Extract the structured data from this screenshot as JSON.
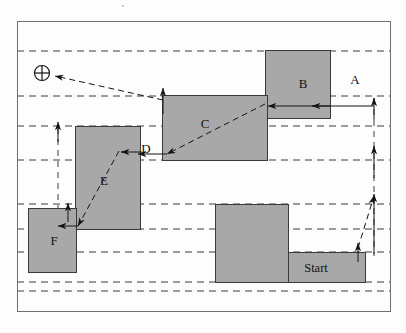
{
  "figure": {
    "width": 406,
    "height": 333,
    "background_color": "#fdfdfd",
    "frame": {
      "name": "outer-frame",
      "x": 17,
      "y": 21,
      "width": 373,
      "height": 290,
      "stroke_color": "#6f6f6f",
      "stroke_width": 1
    },
    "colors": {
      "block_fill": "#a8a8a8",
      "block_stroke": "#3a3a3a",
      "dashed_line": "#3c3c3c",
      "arrow": "#141414",
      "text": "#101010"
    }
  },
  "blocks": [
    {
      "id": "B",
      "label": "B",
      "x": 265,
      "y": 50,
      "width": 65,
      "height": 68,
      "label_x": 303,
      "label_y": 83
    },
    {
      "id": "C",
      "label": "C",
      "x": 162,
      "y": 95,
      "width": 105,
      "height": 65,
      "label_x": 205,
      "label_y": 123
    },
    {
      "id": "E",
      "label": "E",
      "x": 75,
      "y": 126,
      "width": 65,
      "height": 103,
      "label_x": 104,
      "label_y": 180
    },
    {
      "id": "F",
      "label": "F",
      "x": 28,
      "y": 208,
      "width": 48,
      "height": 64,
      "label_x": 54,
      "label_y": 240
    },
    {
      "id": "G",
      "label": "",
      "x": 215,
      "y": 204,
      "width": 73,
      "height": 78,
      "label_x": 0,
      "label_y": 0
    },
    {
      "id": "Start",
      "label": "Start",
      "x": 288,
      "y": 252,
      "width": 77,
      "height": 30,
      "label_x": 316,
      "label_y": 268
    }
  ],
  "free_labels": [
    {
      "id": "A",
      "label": "A",
      "x": 355,
      "y": 79
    },
    {
      "id": "D",
      "label": "D",
      "x": 146,
      "y": 148
    }
  ],
  "target_marker": {
    "name": "circle-plus-target-marker",
    "label": "⊕",
    "cx": 42,
    "cy": 73,
    "r": 7.5
  },
  "dashed_gridlines": [
    {
      "id": "g1",
      "y": 51,
      "x1": 17,
      "x2": 390
    },
    {
      "id": "g2",
      "y": 96,
      "x1": 17,
      "x2": 390
    },
    {
      "id": "g3",
      "y": 126,
      "x1": 17,
      "x2": 390
    },
    {
      "id": "g4",
      "y": 160,
      "x1": 17,
      "x2": 390
    },
    {
      "id": "g5",
      "y": 204,
      "x1": 17,
      "x2": 390
    },
    {
      "id": "g6",
      "y": 229,
      "x1": 17,
      "x2": 390
    },
    {
      "id": "g7",
      "y": 252,
      "x1": 17,
      "x2": 390
    },
    {
      "id": "g8",
      "y": 282,
      "x1": 17,
      "x2": 390
    },
    {
      "id": "g9",
      "y": 291,
      "x1": 17,
      "x2": 390
    }
  ],
  "vertical_dashed": [
    {
      "id": "v-right",
      "x": 374,
      "y1": 98,
      "y2": 256
    },
    {
      "id": "v-left",
      "x": 58,
      "y1": 128,
      "y2": 228
    }
  ],
  "motion_arrows": [
    {
      "id": "a1",
      "name": "arrow-to-target",
      "from_x": 163,
      "from_y": 100,
      "to_x": 55,
      "to_y": 76,
      "style": "dashed"
    },
    {
      "id": "a2",
      "name": "arrow-up-into-c",
      "from_x": 163,
      "from_y": 114,
      "to_x": 163,
      "to_y": 88,
      "style": "solid"
    },
    {
      "id": "a3",
      "name": "arrow-left-b-to-c",
      "from_x": 330,
      "from_y": 106,
      "to_x": 268,
      "to_y": 106,
      "style": "solid"
    },
    {
      "id": "a4",
      "name": "arrow-left-edge-to-b",
      "from_x": 374,
      "from_y": 106,
      "to_x": 312,
      "to_y": 106,
      "style": "solid"
    },
    {
      "id": "a5",
      "name": "arrow-up-left-column",
      "from_x": 58,
      "from_y": 142,
      "to_x": 58,
      "to_y": 122,
      "style": "solid"
    },
    {
      "id": "a6",
      "name": "arrow-c-to-d-diagonal",
      "from_x": 265,
      "from_y": 104,
      "to_x": 167,
      "to_y": 154,
      "style": "dashed"
    },
    {
      "id": "a7",
      "name": "arrow-left-into-d",
      "from_x": 167,
      "from_y": 154,
      "to_x": 138,
      "to_y": 154,
      "style": "solid"
    },
    {
      "id": "a8",
      "name": "arrow-left-into-e",
      "from_x": 142,
      "from_y": 152,
      "to_x": 121,
      "to_y": 152,
      "style": "solid"
    },
    {
      "id": "a9",
      "name": "arrow-e-to-f-diagonal",
      "from_x": 119,
      "from_y": 151,
      "to_x": 78,
      "to_y": 226,
      "style": "dashed"
    },
    {
      "id": "a10",
      "name": "arrow-left-into-f",
      "from_x": 78,
      "from_y": 226,
      "to_x": 58,
      "to_y": 226,
      "style": "solid"
    },
    {
      "id": "a11",
      "name": "arrow-up-f-column",
      "from_x": 68,
      "from_y": 222,
      "to_x": 68,
      "to_y": 203,
      "style": "solid"
    },
    {
      "id": "a12",
      "name": "arrow-start-to-edge",
      "from_x": 358,
      "from_y": 248,
      "to_x": 374,
      "to_y": 196,
      "style": "dashed"
    },
    {
      "id": "a13",
      "name": "arrow-up-start",
      "from_x": 358,
      "from_y": 262,
      "to_x": 358,
      "to_y": 243,
      "style": "solid"
    },
    {
      "id": "a14",
      "name": "arrow-up-right-1",
      "from_x": 374,
      "from_y": 254,
      "to_x": 374,
      "to_y": 194,
      "style": "solid"
    },
    {
      "id": "a15",
      "name": "arrow-up-right-2",
      "from_x": 374,
      "from_y": 178,
      "to_x": 374,
      "to_y": 146,
      "style": "solid"
    },
    {
      "id": "a16",
      "name": "arrow-up-right-3",
      "from_x": 374,
      "from_y": 120,
      "to_x": 374,
      "to_y": 98,
      "style": "solid"
    }
  ],
  "scan_artifacts": [
    {
      "id": "dot1",
      "x": 122,
      "y": 5,
      "size": 2.2
    }
  ]
}
